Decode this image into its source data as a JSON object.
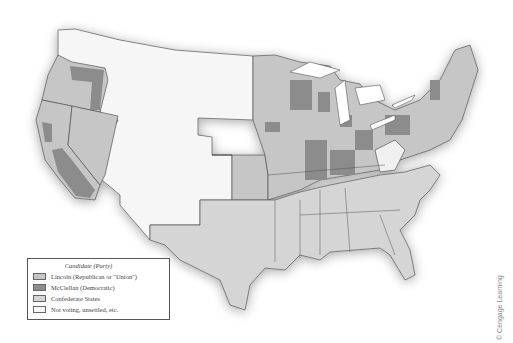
{
  "legend": {
    "title": "Candidate (Party)",
    "items": [
      {
        "label": "Lincoln (Republican or \"Union\")",
        "color": "#c6c6c6"
      },
      {
        "label": "McClellan (Democratic)",
        "color": "#8c8c8c"
      },
      {
        "label": "Confederate States",
        "color": "#d5d5d5"
      },
      {
        "label": "Not voting, unsettled, etc.",
        "color": "#f6f6f6"
      }
    ]
  },
  "credit": "© Cengage Learning",
  "colors": {
    "lincoln": "#c6c6c6",
    "mcclellan": "#8c8c8c",
    "confederate": "#d5d5d5",
    "not_voting": "#f6f6f6",
    "border": "#555555",
    "water": "#ffffff"
  }
}
